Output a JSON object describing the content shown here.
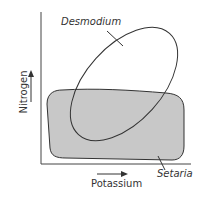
{
  "diagram": {
    "x_axis_label": "Potassium",
    "y_axis_label": "Nitrogen",
    "regions": [
      {
        "name": "Desmodium",
        "shape": "ellipse",
        "fill": "none",
        "stroke": "#333333"
      },
      {
        "name": "Setaria",
        "shape": "rounded-rect",
        "fill": "#c8c8c8",
        "stroke": "#333333"
      }
    ],
    "colors": {
      "line": "#333333",
      "setaria_fill": "#c8c8c8",
      "background": "#ffffff"
    }
  }
}
